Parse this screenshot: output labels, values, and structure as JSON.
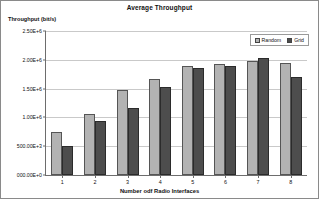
{
  "chart_data": {
    "type": "bar",
    "title": "Average Throughput",
    "xlabel": "Number odf Radio Interfaces",
    "ylabel": "Throughput (bit/s)",
    "categories": [
      "1",
      "2",
      "3",
      "4",
      "5",
      "6",
      "7",
      "8"
    ],
    "series": [
      {
        "name": "Random",
        "color": "#b3b3b3",
        "values": [
          750000,
          1060000,
          1470000,
          1670000,
          1890000,
          1930000,
          1980000,
          1940000
        ]
      },
      {
        "name": "Grid",
        "color": "#4d4d4d",
        "values": [
          505000,
          930000,
          1170000,
          1530000,
          1860000,
          1900000,
          2030000,
          1710000
        ]
      }
    ],
    "ylim": [
      0,
      2500000
    ],
    "ytick_values": [
      0,
      500000,
      1000000,
      1500000,
      2000000,
      2500000
    ],
    "ytick_labels": [
      "000.00E+0",
      "500.00E+3",
      "1.00E+6",
      "1.50E+6",
      "2.00E+6",
      "2.50E+6"
    ],
    "grid": true,
    "legend_position": "top-right"
  }
}
